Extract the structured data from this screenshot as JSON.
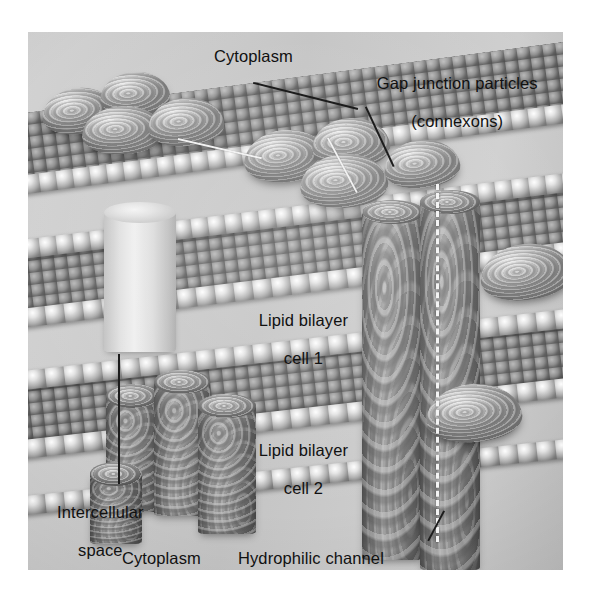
{
  "figure": {
    "kind": "gap-junction-diagram",
    "background_color": "#ffffff",
    "plate_color": "#c9c9c9",
    "text_color": "#111111"
  },
  "labels": {
    "cytoplasm_top": "Cytoplasm",
    "connexons_line1": "Gap junction particles",
    "connexons_line2": "(connexons)",
    "bilayer1_line1": "Lipid bilayer",
    "bilayer1_line2": "cell 1",
    "bilayer2_line1": "Lipid bilayer",
    "bilayer2_line2": "cell 2",
    "intercellular_line1": "Intercellular",
    "intercellular_line2": "space",
    "cytoplasm_bottom": "Cytoplasm",
    "hydrophilic_channel": "Hydrophilic channel"
  },
  "structures": {
    "membrane_cell1_label": "lipid bilayer membrane of cell 1",
    "membrane_cell2_label": "lipid bilayer membrane of cell 2",
    "connexon_particle_label": "gap junction particle (connexon)",
    "connexon_cylinder_label": "connexon channel cylinder",
    "cutaway_cylinder_label": "cut-away hydrophilic channel cylinder",
    "phospholipid_head_label": "phospholipid head group",
    "channel_axis_label": "hydrophilic channel axis"
  }
}
